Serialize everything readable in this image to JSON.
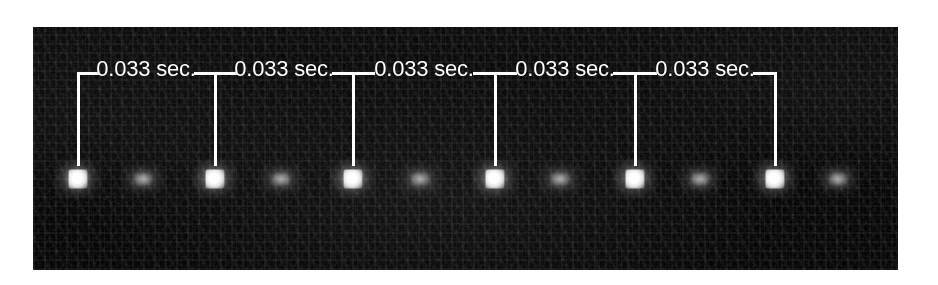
{
  "figure": {
    "kind": "stroboscopic-photograph",
    "background_color": "#ffffff",
    "plate": {
      "background_color": "#050505",
      "left": 33,
      "top": 27,
      "width": 865,
      "height": 243,
      "description": "Dark, grainy stroboscopic photograph of a falling object"
    },
    "annotation": {
      "line_color": "#ffffff",
      "text_color": "#ffffff",
      "rule_y": 72,
      "tick_bottom_y": 166,
      "labels": [
        {
          "text": "0.033 sec.",
          "center_x": 146,
          "center_y": 69
        },
        {
          "text": "0.033 sec.",
          "center_x": 284,
          "center_y": 69
        },
        {
          "text": "0.033 sec.",
          "center_x": 424,
          "center_y": 69
        },
        {
          "text": "0.033 sec.",
          "center_x": 565,
          "center_y": 69
        },
        {
          "text": "0.033 sec.",
          "center_x": 705,
          "center_y": 69
        }
      ],
      "ticks": [
        {
          "x": 78
        },
        {
          "x": 215
        },
        {
          "x": 353
        },
        {
          "x": 495
        },
        {
          "x": 635
        },
        {
          "x": 775
        }
      ],
      "segments": [
        {
          "x1": 78,
          "x2": 215
        },
        {
          "x1": 215,
          "x2": 353
        },
        {
          "x1": 353,
          "x2": 495
        },
        {
          "x1": 495,
          "x2": 635
        },
        {
          "x1": 635,
          "x2": 775
        }
      ]
    },
    "flashes": {
      "center_y": 179,
      "primary": [
        {
          "x": 78
        },
        {
          "x": 215
        },
        {
          "x": 353
        },
        {
          "x": 495
        },
        {
          "x": 635
        },
        {
          "x": 775
        }
      ],
      "secondary": [
        {
          "x": 143
        },
        {
          "x": 281
        },
        {
          "x": 420
        },
        {
          "x": 560
        },
        {
          "x": 700
        },
        {
          "x": 838
        }
      ]
    }
  },
  "measurements": {
    "strobe_interval_value": "0.033",
    "strobe_interval_unit": "sec.",
    "interval_count": 5,
    "flash_count": 6
  }
}
